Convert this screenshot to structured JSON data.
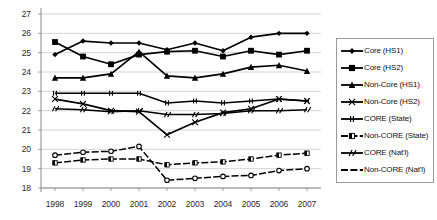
{
  "chart_data": {
    "type": "line",
    "title": "",
    "xlabel": "",
    "ylabel": "",
    "grid": true,
    "legend_position": "right",
    "categories": [
      "1998",
      "1999",
      "2000",
      "2001",
      "2002",
      "2003",
      "2004",
      "2005",
      "2006",
      "2007"
    ],
    "x": [
      1998,
      1999,
      2000,
      2001,
      2002,
      2003,
      2004,
      2005,
      2006,
      2007
    ],
    "xlim": [
      1997.5,
      2007.5
    ],
    "ylim": [
      18,
      27
    ],
    "yticks": [
      18,
      19,
      20,
      21,
      22,
      23,
      24,
      25,
      26,
      27
    ],
    "series": [
      {
        "name": "Core (HS1)",
        "marker": "diamond",
        "values": [
          24.9,
          25.6,
          25.5,
          25.5,
          25.15,
          25.5,
          25.1,
          25.8,
          26.0,
          26.0
        ]
      },
      {
        "name": "Core (HS2)",
        "marker": "square",
        "values": [
          25.55,
          24.8,
          24.4,
          24.9,
          25.05,
          25.1,
          24.8,
          25.1,
          24.9,
          25.1
        ]
      },
      {
        "name": "Non-Core (HS1)",
        "marker": "triangle",
        "values": [
          23.7,
          23.7,
          23.9,
          25.05,
          23.8,
          23.7,
          23.9,
          24.25,
          24.35,
          24.05
        ]
      },
      {
        "name": "Non-Core (HS2)",
        "marker": "x",
        "values": [
          22.6,
          22.35,
          22.0,
          21.95,
          20.75,
          21.4,
          21.9,
          22.1,
          22.6,
          22.5
        ]
      },
      {
        "name": "CORE (State)",
        "marker": "bar",
        "values": [
          22.9,
          22.9,
          22.9,
          22.9,
          22.4,
          22.5,
          22.4,
          22.5,
          22.6,
          22.5
        ]
      },
      {
        "name": "Non-CORE (State)",
        "marker": "halfbar",
        "values": [
          19.3,
          19.45,
          19.5,
          19.5,
          19.2,
          19.3,
          19.35,
          19.5,
          19.7,
          19.8
        ]
      },
      {
        "name": "CORE (Nat'l)",
        "marker": "slash",
        "values": [
          22.1,
          22.05,
          21.95,
          22.0,
          21.8,
          21.8,
          21.85,
          22.0,
          22.0,
          22.05
        ]
      },
      {
        "name": "Non-CORE (Nat'l)",
        "marker": "dash",
        "values": [
          19.7,
          19.85,
          19.9,
          20.15,
          18.4,
          18.5,
          18.6,
          18.65,
          18.9,
          19.0
        ]
      }
    ]
  },
  "axis": {
    "ylabels": [
      "27",
      "26",
      "25",
      "24",
      "23",
      "22",
      "21",
      "20",
      "19",
      "18"
    ],
    "xlabels": [
      "1998",
      "1999",
      "2000",
      "2001",
      "2002",
      "2003",
      "2004",
      "2005",
      "2006",
      "2007"
    ]
  },
  "legend": {
    "items": [
      {
        "label": "Core (HS1)"
      },
      {
        "label": "Core (HS2)"
      },
      {
        "label": "Non-Core (HS1)"
      },
      {
        "label": "Non-Core (HS2)"
      },
      {
        "label": "CORE (State)"
      },
      {
        "label": "Non-CORE (State)"
      },
      {
        "label": "CORE (Nat'l)"
      },
      {
        "label": "Non-CORE (Nat'l)"
      }
    ]
  },
  "colors": {
    "series": "#000000",
    "grid": "#c9c9c9",
    "axis": "#8a8a8a",
    "text": "#2b2b2b",
    "background": "#ffffff",
    "legend_border": "#9a9a9a"
  }
}
